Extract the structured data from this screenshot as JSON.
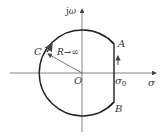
{
  "diagram": {
    "type": "s-plane contour",
    "axes": {
      "imag_label_j": "j",
      "imag_label_omega": "ω",
      "real_label": "σ"
    },
    "labels": {
      "origin": "O",
      "point_a": "A",
      "point_b": "B",
      "point_c": "C",
      "radius": "R→∞",
      "sigma0_base": "σ",
      "sigma0_sub": "0"
    },
    "colors": {
      "contour": "#222222",
      "axes": "#555555",
      "text": "#333333"
    }
  }
}
